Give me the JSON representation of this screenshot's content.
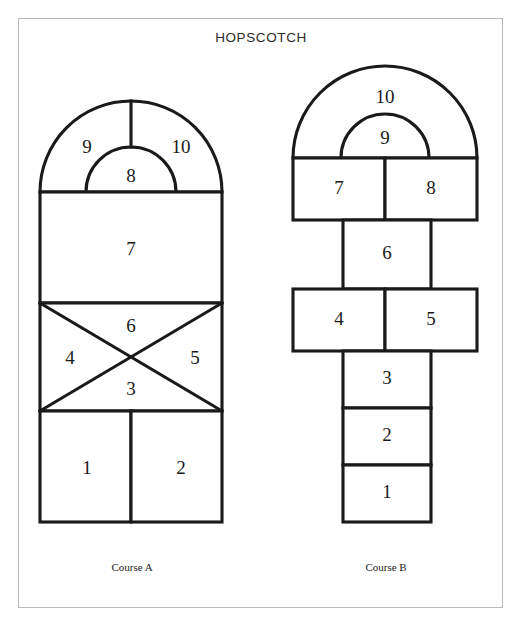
{
  "page": {
    "title": "HOPSCOTCH",
    "background_color": "#ffffff",
    "border_color": "#b8b8b8",
    "ink_color": "#1a1a1a"
  },
  "diagram": {
    "type": "hopscotch-court-diagram",
    "courses": [
      {
        "id": "course-a",
        "caption": "Course A",
        "shape": "rounded-top rectangle with arch, single column of cells",
        "cells": [
          {
            "label": "1",
            "region": "bottom-left square"
          },
          {
            "label": "2",
            "region": "bottom-right square"
          },
          {
            "label": "3",
            "region": "x-section bottom triangle"
          },
          {
            "label": "4",
            "region": "x-section left triangle"
          },
          {
            "label": "5",
            "region": "x-section right triangle"
          },
          {
            "label": "6",
            "region": "x-section top triangle"
          },
          {
            "label": "7",
            "region": "large middle rectangle"
          },
          {
            "label": "8",
            "region": "inner semicircle in arch"
          },
          {
            "label": "9",
            "region": "arch left"
          },
          {
            "label": "10",
            "region": "arch right"
          }
        ]
      },
      {
        "id": "course-b",
        "caption": "Course B",
        "shape": "vertical ladder with two wide rows and an arch on top",
        "cells": [
          {
            "label": "1",
            "region": "bottom narrow box"
          },
          {
            "label": "2",
            "region": "narrow box"
          },
          {
            "label": "3",
            "region": "narrow box"
          },
          {
            "label": "4",
            "region": "wide row left"
          },
          {
            "label": "5",
            "region": "wide row right"
          },
          {
            "label": "6",
            "region": "narrow box"
          },
          {
            "label": "7",
            "region": "wide row left"
          },
          {
            "label": "8",
            "region": "wide row right"
          },
          {
            "label": "9",
            "region": "inner arch"
          },
          {
            "label": "10",
            "region": "outer arch"
          }
        ]
      }
    ]
  }
}
